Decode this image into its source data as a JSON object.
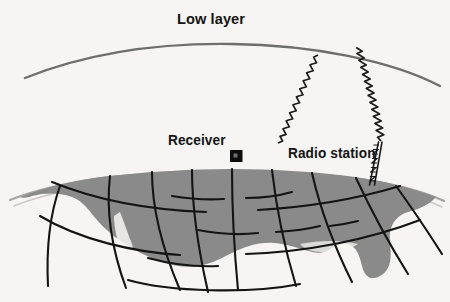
{
  "diagram": {
    "title": "Low layer",
    "background_color": "#f6f5f3",
    "labels": {
      "low_layer": "Low layer",
      "receiver": "Receiver",
      "radio_station": "Radio station"
    },
    "colors": {
      "ionosphere_line": "#6e6e6e",
      "landmass_fill": "#8a8a8a",
      "grid_line": "#141414",
      "horizon_line": "#9a9a9a",
      "receiver_box": "#0d0d0d",
      "tower": "#141414",
      "wave": "#1a1a1a",
      "text": "#141414"
    },
    "elements": {
      "ionosphere_arc": {
        "name": "Low layer",
        "start_x": 25,
        "start_y": 78,
        "peak_x": 232,
        "peak_y": 44,
        "end_x": 440,
        "end_y": 86
      },
      "earth_cap": {
        "name": "Earth surface",
        "top_peak_x": 230,
        "top_peak_y": 168,
        "left_x": 12,
        "right_x": 440
      },
      "receiver": {
        "x": 231,
        "y": 151,
        "size": 11
      },
      "radio_tower": {
        "base_x": 372,
        "base_y": 184,
        "top_x": 380,
        "top_y": 143,
        "sections": 9
      },
      "wave_bounce_point": {
        "x": 320,
        "y": 52
      },
      "wave_paths": [
        {
          "name": "uplink",
          "from": "radio-station",
          "to": "ionosphere"
        },
        {
          "name": "downlink",
          "from": "ionosphere",
          "to": "receiver"
        }
      ],
      "grid": {
        "meridians": 8,
        "parallels": 3
      }
    }
  }
}
